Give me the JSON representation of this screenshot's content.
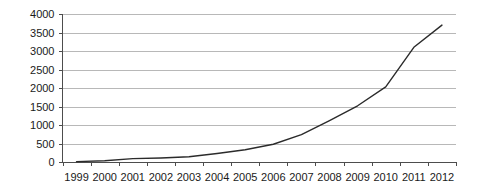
{
  "chart_data": {
    "type": "line",
    "title": "",
    "subtitle": "",
    "xlabel": "",
    "ylabel": "",
    "categories": [
      "1999",
      "2000",
      "2001",
      "2002",
      "2003",
      "2004",
      "2005",
      "2006",
      "2007",
      "2008",
      "2009",
      "2010",
      "2011",
      "2012"
    ],
    "series": [
      {
        "name": "",
        "values": [
          10,
          35,
          90,
          110,
          140,
          230,
          330,
          480,
          740,
          1120,
          1520,
          2030,
          3100,
          3700
        ]
      }
    ],
    "x": [
      "1999",
      "2000",
      "2001",
      "2002",
      "2003",
      "2004",
      "2005",
      "2006",
      "2007",
      "2008",
      "2009",
      "2010",
      "2011",
      "2012"
    ],
    "values": [
      10,
      35,
      90,
      110,
      140,
      230,
      330,
      480,
      740,
      1120,
      1520,
      2030,
      3100,
      3700
    ],
    "ylim": [
      0,
      4000
    ],
    "ytick_labels": [
      "0",
      "500",
      "1000",
      "1500",
      "2000",
      "2500",
      "3000",
      "3500",
      "4000"
    ],
    "ytick_values": [
      0,
      500,
      1000,
      1500,
      2000,
      2500,
      3000,
      3500,
      4000
    ],
    "xtick_labels": [
      "1999",
      "2000",
      "2001",
      "2002",
      "2003",
      "2004",
      "2005",
      "2006",
      "2007",
      "2008",
      "2009",
      "2010",
      "2011",
      "2012"
    ],
    "grid": true,
    "grid_axis": "y",
    "legend": false,
    "legend_position": "none",
    "line_color": "#2b2b2b",
    "grid_color": "#b8b8b8",
    "axis_color": "#4d4d4d",
    "text_color": "#1a1a1a",
    "background_color": "#ffffff",
    "markers": false,
    "annotations": []
  }
}
